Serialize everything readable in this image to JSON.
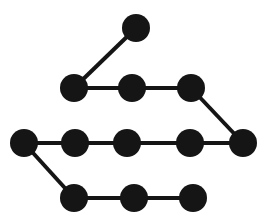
{
  "figure": {
    "width": 275,
    "height": 222,
    "background_color": "#ffffff",
    "node_color": "#151515",
    "edge_color": "#151515",
    "node_radius": 14,
    "edge_width": 4
  },
  "graph": {
    "type": "undirected-path",
    "node_count": 12,
    "edge_count": 11,
    "nodes": [
      {
        "id": "n1",
        "label": "1",
        "x": 136,
        "y": 28,
        "row": 1
      },
      {
        "id": "n2",
        "label": "2",
        "x": 74,
        "y": 88,
        "row": 2
      },
      {
        "id": "n3",
        "label": "3",
        "x": 132,
        "y": 88,
        "row": 2
      },
      {
        "id": "n4",
        "label": "4",
        "x": 191,
        "y": 88,
        "row": 2
      },
      {
        "id": "n5",
        "label": "5",
        "x": 243,
        "y": 143,
        "row": 3
      },
      {
        "id": "n6",
        "label": "6",
        "x": 190,
        "y": 143,
        "row": 3
      },
      {
        "id": "n7",
        "label": "7",
        "x": 127,
        "y": 143,
        "row": 3
      },
      {
        "id": "n8",
        "label": "8",
        "x": 75,
        "y": 143,
        "row": 3
      },
      {
        "id": "n9",
        "label": "9",
        "x": 24,
        "y": 143,
        "row": 3
      },
      {
        "id": "n10",
        "label": "10",
        "x": 74,
        "y": 198,
        "row": 4
      },
      {
        "id": "n11",
        "label": "11",
        "x": 134,
        "y": 198,
        "row": 4
      },
      {
        "id": "n12",
        "label": "12",
        "x": 193,
        "y": 198,
        "row": 4
      }
    ],
    "edges": [
      {
        "id": "e1",
        "from": "n1",
        "to": "n2",
        "x1": 136,
        "y1": 28,
        "x2": 74,
        "y2": 88
      },
      {
        "id": "e2",
        "from": "n2",
        "to": "n3",
        "x1": 74,
        "y1": 88,
        "x2": 132,
        "y2": 88
      },
      {
        "id": "e3",
        "from": "n3",
        "to": "n4",
        "x1": 132,
        "y1": 88,
        "x2": 191,
        "y2": 88
      },
      {
        "id": "e4",
        "from": "n4",
        "to": "n5",
        "x1": 191,
        "y1": 88,
        "x2": 243,
        "y2": 143
      },
      {
        "id": "e5",
        "from": "n5",
        "to": "n6",
        "x1": 243,
        "y1": 143,
        "x2": 190,
        "y2": 143
      },
      {
        "id": "e6",
        "from": "n6",
        "to": "n7",
        "x1": 190,
        "y1": 143,
        "x2": 127,
        "y2": 143
      },
      {
        "id": "e7",
        "from": "n7",
        "to": "n8",
        "x1": 127,
        "y1": 143,
        "x2": 75,
        "y2": 143
      },
      {
        "id": "e8",
        "from": "n8",
        "to": "n9",
        "x1": 75,
        "y1": 143,
        "x2": 24,
        "y2": 143
      },
      {
        "id": "e9",
        "from": "n9",
        "to": "n10",
        "x1": 24,
        "y1": 143,
        "x2": 74,
        "y2": 198
      },
      {
        "id": "e10",
        "from": "n10",
        "to": "n11",
        "x1": 74,
        "y1": 198,
        "x2": 134,
        "y2": 198
      },
      {
        "id": "e11",
        "from": "n11",
        "to": "n12",
        "x1": 134,
        "y1": 198,
        "x2": 193,
        "y2": 198
      }
    ]
  }
}
